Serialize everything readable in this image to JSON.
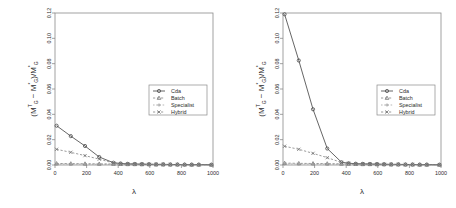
{
  "figure": {
    "type": "multi-panel-line-chart",
    "panels": 2,
    "background": "#ffffff",
    "axis_color": "#8a8a8a"
  },
  "chart_data": [
    {
      "type": "line",
      "panel": "left",
      "title": "",
      "xlabel": "λ",
      "ylabel": "(Mᴳᵀ − Mᴳ*)/Mᴳ*",
      "ylabel_parts": {
        "open": "(",
        "m1_base": "M",
        "m1_sup": "T",
        "m1_sub": "G",
        "minus": "−",
        "m2_base": "M",
        "m2_sup": "*",
        "m2_sub": "G",
        "close": ")/",
        "m3_base": "M",
        "m3_sup": "*",
        "m3_sub": "G"
      },
      "xlim": [
        0,
        1000
      ],
      "ylim": [
        0.0,
        0.12
      ],
      "xticks": [
        0,
        200,
        400,
        600,
        800,
        1000
      ],
      "xtick_labels": [
        "0",
        "200",
        "400",
        "600",
        "800",
        "1000"
      ],
      "yticks": [
        0.0,
        0.02,
        0.04,
        0.06,
        0.08,
        0.1,
        0.12
      ],
      "ytick_labels": [
        "0.00",
        "0.02",
        "0.04",
        "0.06",
        "0.08",
        "0.10",
        "0.12"
      ],
      "grid": false,
      "legend_position": "center-right",
      "series": [
        {
          "name": "Cda",
          "marker": "circle",
          "linestyle": "solid",
          "color": "#4a4a4a",
          "x": [
            10,
            100,
            190,
            280,
            370,
            415,
            460,
            505,
            550,
            595,
            640,
            685,
            730,
            775,
            820,
            865,
            910,
            990
          ],
          "values": [
            0.031,
            0.0228,
            0.015,
            0.0063,
            0.0018,
            0.0012,
            0.0009,
            0.0008,
            0.0007,
            0.0006,
            0.0005,
            0.0005,
            0.0004,
            0.0004,
            0.0003,
            0.0003,
            0.0003,
            0.0002
          ]
        },
        {
          "name": "Batch",
          "marker": "triangle",
          "linestyle": "dashed",
          "color": "#7a7a7a",
          "x": [
            10,
            100,
            190,
            280,
            370,
            415,
            460,
            505,
            550,
            595,
            640,
            685,
            730,
            775,
            820,
            865,
            910,
            990
          ],
          "values": [
            0.0012,
            0.0011,
            0.001,
            0.0009,
            0.0008,
            0.0007,
            0.0006,
            0.0006,
            0.0005,
            0.0005,
            0.0004,
            0.0004,
            0.0003,
            0.0003,
            0.0003,
            0.0002,
            0.0002,
            0.0002
          ]
        },
        {
          "name": "Specialist",
          "marker": "plus",
          "linestyle": "dotted",
          "color": "#9a9a9a",
          "x": [
            10,
            100,
            190,
            280,
            370,
            415,
            460,
            505,
            550,
            595,
            640,
            685,
            730,
            775,
            820,
            865,
            910,
            990
          ],
          "values": [
            0.0008,
            0.0007,
            0.0007,
            0.0006,
            0.0005,
            0.0005,
            0.0004,
            0.0004,
            0.0004,
            0.0003,
            0.0003,
            0.0003,
            0.0002,
            0.0002,
            0.0002,
            0.0002,
            0.0001,
            0.0001
          ]
        },
        {
          "name": "Hybrid",
          "marker": "cross",
          "linestyle": "dashed",
          "color": "#6f6f6f",
          "x": [
            10,
            100,
            190,
            280,
            370,
            415,
            460,
            505,
            550,
            595,
            640,
            685,
            730,
            775,
            820,
            865,
            910,
            990
          ],
          "values": [
            0.0124,
            0.01,
            0.0074,
            0.0046,
            0.0016,
            0.0011,
            0.0009,
            0.0008,
            0.0007,
            0.0006,
            0.0005,
            0.0005,
            0.0004,
            0.0004,
            0.0003,
            0.0003,
            0.0003,
            0.0002
          ]
        }
      ]
    },
    {
      "type": "line",
      "panel": "right",
      "title": "",
      "xlabel": "λ",
      "ylabel": "(Mᴳᵀ − Mᴳ*)/Mᴳ*",
      "ylabel_parts": {
        "open": "(",
        "m1_base": "M",
        "m1_sup": "T",
        "m1_sub": "G",
        "minus": "−",
        "m2_base": "M",
        "m2_sup": "*",
        "m2_sub": "G",
        "close": ")/",
        "m3_base": "M",
        "m3_sup": "*",
        "m3_sub": "G"
      },
      "xlim": [
        0,
        1000
      ],
      "ylim": [
        0.0,
        0.12
      ],
      "xticks": [
        0,
        200,
        400,
        600,
        800,
        1000
      ],
      "xtick_labels": [
        "0",
        "200",
        "400",
        "600",
        "800",
        "1000"
      ],
      "yticks": [
        0.0,
        0.02,
        0.04,
        0.06,
        0.08,
        0.1,
        0.12
      ],
      "ytick_labels": [
        "0.00",
        "0.02",
        "0.04",
        "0.06",
        "0.08",
        "0.10",
        "0.12"
      ],
      "grid": false,
      "legend_position": "center-right",
      "series": [
        {
          "name": "Cda",
          "marker": "circle",
          "linestyle": "solid",
          "color": "#4a4a4a",
          "x": [
            10,
            100,
            190,
            280,
            370,
            415,
            460,
            505,
            550,
            595,
            640,
            685,
            730,
            775,
            820,
            865,
            910,
            990
          ],
          "values": [
            0.119,
            0.0825,
            0.044,
            0.013,
            0.0022,
            0.0014,
            0.001,
            0.0009,
            0.0008,
            0.0007,
            0.0006,
            0.0005,
            0.0005,
            0.0004,
            0.0004,
            0.0003,
            0.0003,
            0.0002
          ]
        },
        {
          "name": "Batch",
          "marker": "triangle",
          "linestyle": "dashed",
          "color": "#7a7a7a",
          "x": [
            10,
            100,
            190,
            280,
            370,
            415,
            460,
            505,
            550,
            595,
            640,
            685,
            730,
            775,
            820,
            865,
            910,
            990
          ],
          "values": [
            0.0015,
            0.0013,
            0.0012,
            0.0011,
            0.0009,
            0.0008,
            0.0007,
            0.0006,
            0.0006,
            0.0005,
            0.0005,
            0.0004,
            0.0004,
            0.0003,
            0.0003,
            0.0002,
            0.0002,
            0.0002
          ]
        },
        {
          "name": "Specialist",
          "marker": "plus",
          "linestyle": "dotted",
          "color": "#9a9a9a",
          "x": [
            10,
            100,
            190,
            280,
            370,
            415,
            460,
            505,
            550,
            595,
            640,
            685,
            730,
            775,
            820,
            865,
            910,
            990
          ],
          "values": [
            0.0009,
            0.0008,
            0.0008,
            0.0007,
            0.0006,
            0.0005,
            0.0005,
            0.0004,
            0.0004,
            0.0003,
            0.0003,
            0.0003,
            0.0002,
            0.0002,
            0.0002,
            0.0002,
            0.0001,
            0.0001
          ]
        },
        {
          "name": "Hybrid",
          "marker": "cross",
          "linestyle": "dashed",
          "color": "#6f6f6f",
          "x": [
            10,
            100,
            190,
            280,
            370,
            415,
            460,
            505,
            550,
            595,
            640,
            685,
            730,
            775,
            820,
            865,
            910,
            990
          ],
          "values": [
            0.0148,
            0.0124,
            0.0092,
            0.0058,
            0.002,
            0.0013,
            0.001,
            0.0009,
            0.0008,
            0.0007,
            0.0006,
            0.0005,
            0.0005,
            0.0004,
            0.0004,
            0.0003,
            0.0003,
            0.0002
          ]
        }
      ]
    }
  ],
  "legend": {
    "entries": [
      {
        "label": "Cda",
        "marker": "circle",
        "linestyle": "solid"
      },
      {
        "label": "Batch",
        "marker": "triangle",
        "linestyle": "dashed"
      },
      {
        "label": "Specialist",
        "marker": "plus",
        "linestyle": "dotted"
      },
      {
        "label": "Hybrid",
        "marker": "cross",
        "linestyle": "dashed"
      }
    ]
  }
}
